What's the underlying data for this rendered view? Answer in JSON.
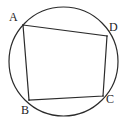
{
  "figure": {
    "kind": "cyclic-quadrilateral-in-circle",
    "background_color": "#ffffff",
    "stroke_color": "#2b2b2b",
    "label_color": "#1c1c1c",
    "canvas": {
      "width": 125,
      "height": 124
    },
    "circle": {
      "name": "circumscribed-circle",
      "cx": 63.5,
      "cy": 61.5,
      "r": 54.5,
      "stroke_width": 1.2
    },
    "quadrilateral": {
      "name": "quadrilateral-ABCD",
      "stroke_width": 1.2,
      "points": "23,25 107,36 103,96 29,100",
      "vertices": [
        {
          "id": "A",
          "label": "A",
          "x": 23,
          "y": 25
        },
        {
          "id": "D",
          "label": "D",
          "x": 107,
          "y": 36
        },
        {
          "id": "C",
          "label": "C",
          "x": 103,
          "y": 96
        },
        {
          "id": "B",
          "label": "B",
          "x": 29,
          "y": 100
        }
      ],
      "sides": [
        {
          "name": "side-AD",
          "from": "A",
          "to": "D"
        },
        {
          "name": "side-DC",
          "from": "D",
          "to": "C"
        },
        {
          "name": "side-CB",
          "from": "C",
          "to": "B"
        },
        {
          "name": "side-BA",
          "from": "B",
          "to": "A"
        }
      ]
    },
    "labels": {
      "A": "A",
      "B": "B",
      "C": "C",
      "D": "D"
    }
  }
}
